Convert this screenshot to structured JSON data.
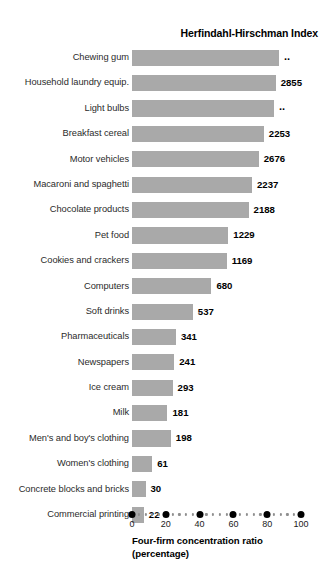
{
  "chart_data": {
    "type": "bar",
    "orientation": "horizontal",
    "title": "Herfindahl-Hirschman Index",
    "xlabel_lines": [
      "Four-firm concentration ratio",
      "(percentage)"
    ],
    "ylabel": "",
    "xlim": [
      0,
      100
    ],
    "xticks": [
      0,
      20,
      40,
      60,
      80,
      100
    ],
    "xtick_labels": [
      "0",
      "20",
      "40",
      "60",
      "80",
      "100"
    ],
    "grid": false,
    "legend": null,
    "bar_color": "#a9a9a9",
    "categories": [
      "Chewing gum",
      "Household laundry equip.",
      "Light bulbs",
      "Breakfast cereal",
      "Motor vehicles",
      "Macaroni and spaghetti",
      "Chocolate products",
      "Pet food",
      "Cookies and crackers",
      "Computers",
      "Soft drinks",
      "Pharmaceuticals",
      "Newspapers",
      "Ice cream",
      "Milk",
      "Men's and boy's clothing",
      "Women's clothing",
      "Concrete blocks and bricks",
      "Commercial printing"
    ],
    "values": [
      87,
      85,
      84,
      78,
      75,
      71,
      69,
      57,
      56,
      47,
      36,
      26,
      25,
      24,
      21,
      23,
      12,
      8,
      7
    ],
    "data_labels": [
      "..",
      "2855",
      "..",
      "2253",
      "2676",
      "2237",
      "2188",
      "1229",
      "1169",
      "680",
      "537",
      "341",
      "241",
      "293",
      "181",
      "198",
      "61",
      "30",
      "22"
    ],
    "series": [
      {
        "name": "Four-firm concentration ratio (percentage)",
        "values": [
          87,
          85,
          84,
          78,
          75,
          71,
          69,
          57,
          56,
          47,
          36,
          26,
          25,
          24,
          21,
          23,
          12,
          8,
          7
        ]
      },
      {
        "name": "Herfindahl-Hirschman Index",
        "values": [
          "..",
          2855,
          "..",
          2253,
          2676,
          2237,
          2188,
          1229,
          1169,
          680,
          537,
          341,
          241,
          293,
          181,
          198,
          61,
          30,
          22
        ]
      }
    ],
    "rows": [
      {
        "label": "Chewing gum",
        "ratio": 87,
        "hhi": ".."
      },
      {
        "label": "Household laundry equip.",
        "ratio": 85,
        "hhi": "2855"
      },
      {
        "label": "Light bulbs",
        "ratio": 84,
        "hhi": ".."
      },
      {
        "label": "Breakfast cereal",
        "ratio": 78,
        "hhi": "2253"
      },
      {
        "label": "Motor vehicles",
        "ratio": 75,
        "hhi": "2676"
      },
      {
        "label": "Macaroni and spaghetti",
        "ratio": 71,
        "hhi": "2237"
      },
      {
        "label": "Chocolate products",
        "ratio": 69,
        "hhi": "2188"
      },
      {
        "label": "Pet food",
        "ratio": 57,
        "hhi": "1229"
      },
      {
        "label": "Cookies and crackers",
        "ratio": 56,
        "hhi": "1169"
      },
      {
        "label": "Computers",
        "ratio": 47,
        "hhi": "680"
      },
      {
        "label": "Soft drinks",
        "ratio": 36,
        "hhi": "537"
      },
      {
        "label": "Pharmaceuticals",
        "ratio": 26,
        "hhi": "341"
      },
      {
        "label": "Newspapers",
        "ratio": 25,
        "hhi": "241"
      },
      {
        "label": "Ice cream",
        "ratio": 24,
        "hhi": "293"
      },
      {
        "label": "Milk",
        "ratio": 21,
        "hhi": "181"
      },
      {
        "label": "Men's and boy's clothing",
        "ratio": 23,
        "hhi": "198"
      },
      {
        "label": "Women's clothing",
        "ratio": 12,
        "hhi": "61"
      },
      {
        "label": "Concrete blocks and bricks",
        "ratio": 8,
        "hhi": "30"
      },
      {
        "label": "Commercial printing",
        "ratio": 7,
        "hhi": "22"
      }
    ]
  }
}
